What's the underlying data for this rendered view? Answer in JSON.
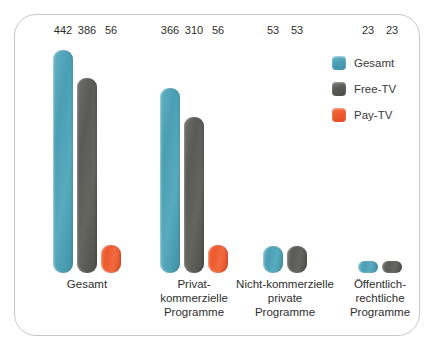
{
  "legend": {
    "items": [
      {
        "label": "Gesamt",
        "color": "#4a9fb5",
        "swatch": "teal"
      },
      {
        "label": "Free-TV",
        "color": "#5a5a57",
        "swatch": "gray"
      },
      {
        "label": "Pay-TV",
        "color": "#ee5a2e",
        "swatch": "orange"
      }
    ]
  },
  "chart_data": {
    "type": "bar",
    "title": "",
    "xlabel": "",
    "ylabel": "",
    "grid": false,
    "legend_position": "top-right",
    "ylim": [
      0,
      442
    ],
    "categories": [
      "Gesamt",
      "Privat-\nkommerzielle\nProgramme",
      "Nicht-kommerzielle\nprivate\nProgramme",
      "Öffentlich-\nrechtliche\nProgramme"
    ],
    "series": [
      {
        "name": "Gesamt",
        "color": "#4a9fb5",
        "values": [
          442,
          366,
          53,
          23
        ]
      },
      {
        "name": "Free-TV",
        "color": "#5a5a57",
        "values": [
          386,
          310,
          53,
          23
        ]
      },
      {
        "name": "Pay-TV",
        "color": "#ee5a2e",
        "values": [
          56,
          56,
          null,
          null
        ]
      }
    ]
  }
}
